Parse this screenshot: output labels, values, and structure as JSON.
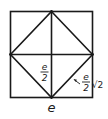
{
  "diagram": {
    "labels": {
      "half_side_numerator": "e",
      "half_side_denominator": "2",
      "diagonal_numerator": "e",
      "diagonal_denominator": "2",
      "diagonal_radical": "√2",
      "side": "e"
    },
    "colors": {
      "stroke": "#1a1a1a",
      "background": "#ffffff"
    }
  }
}
